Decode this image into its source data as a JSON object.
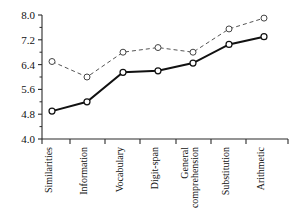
{
  "chart_data": {
    "type": "line",
    "title": "",
    "subtitle": "",
    "xlabel": "",
    "ylabel": "",
    "ylim": [
      4.0,
      8.0
    ],
    "ytick_labels": [
      "8.0",
      "7.2",
      "6.4",
      "5.6",
      "4.8",
      "4.0"
    ],
    "ytick_values": [
      8.0,
      7.2,
      6.4,
      5.6,
      4.8,
      4.0
    ],
    "yminor_values": [
      7.6,
      6.8,
      6.0,
      5.2,
      4.4
    ],
    "grid": false,
    "legend": "none",
    "categories": [
      "Similarities",
      "Information",
      "Vocabulary",
      "Digit-span",
      "General comprehension",
      "Substitution",
      "Arithmetic"
    ],
    "category_lines": [
      [
        "Similarities"
      ],
      [
        "Information"
      ],
      [
        "Vocabulary"
      ],
      [
        "Digit-span"
      ],
      [
        "General",
        "comprehension"
      ],
      [
        "Substitution"
      ],
      [
        "Arithmetic"
      ]
    ],
    "series": [
      {
        "name": "upper-dashed-series",
        "style": "dashed",
        "marker": "open-circle",
        "color": "#555555",
        "values": [
          6.5,
          6.0,
          6.8,
          6.95,
          6.8,
          7.55,
          7.9
        ]
      },
      {
        "name": "lower-solid-series",
        "style": "solid",
        "marker": "open-circle",
        "color": "#111111",
        "values": [
          4.9,
          5.2,
          6.15,
          6.2,
          6.45,
          7.05,
          7.3
        ]
      }
    ]
  },
  "geometry": {
    "plot_left": 42,
    "plot_right": 288,
    "plot_top": 15,
    "plot_bottom": 139,
    "point_x": [
      52,
      87,
      123,
      158,
      193,
      229,
      264
    ],
    "tick_x": [
      42,
      70,
      105,
      140,
      176,
      211,
      246,
      288
    ]
  }
}
